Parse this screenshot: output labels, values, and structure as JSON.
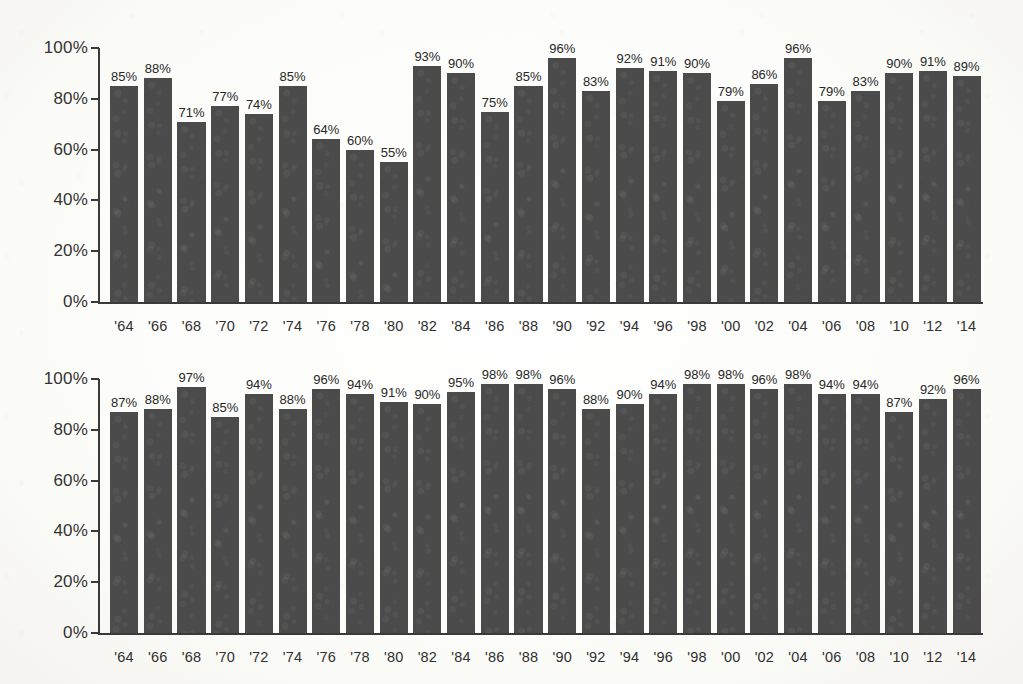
{
  "chart_data": [
    {
      "id": "chart-top",
      "type": "bar",
      "title": "",
      "subtitle": "",
      "xlabel": "",
      "ylabel": "",
      "ylim": [
        0,
        100
      ],
      "y_ticks": [
        0,
        20,
        40,
        60,
        80,
        100
      ],
      "y_tick_labels": [
        "0%",
        "20%",
        "40%",
        "60%",
        "80%",
        "100%"
      ],
      "grid": false,
      "legend": null,
      "value_label_suffix": "%",
      "bar_color": "#4b4b4b",
      "categories": [
        "'64",
        "'66",
        "'68",
        "'70",
        "'72",
        "'74",
        "'76",
        "'78",
        "'80",
        "'82",
        "'84",
        "'86",
        "'88",
        "'90",
        "'92",
        "'94",
        "'96",
        "'98",
        "'00",
        "'02",
        "'04",
        "'06",
        "'08",
        "'10",
        "'12",
        "'14"
      ],
      "values": [
        85,
        88,
        71,
        77,
        74,
        85,
        64,
        60,
        55,
        93,
        90,
        75,
        85,
        96,
        83,
        92,
        91,
        90,
        79,
        86,
        96,
        79,
        83,
        90,
        91,
        89
      ],
      "value_labels": [
        "85%",
        "88%",
        "71%",
        "77%",
        "74%",
        "85%",
        "64%",
        "60%",
        "55%",
        "93%",
        "90%",
        "75%",
        "85%",
        "96%",
        "83%",
        "92%",
        "91%",
        "90%",
        "79%",
        "86%",
        "96%",
        "79%",
        "83%",
        "90%",
        "91%",
        "89%"
      ]
    },
    {
      "id": "chart-bottom",
      "type": "bar",
      "title": "",
      "subtitle": "",
      "xlabel": "",
      "ylabel": "",
      "ylim": [
        0,
        100
      ],
      "y_ticks": [
        0,
        20,
        40,
        60,
        80,
        100
      ],
      "y_tick_labels": [
        "0%",
        "20%",
        "40%",
        "60%",
        "80%",
        "100%"
      ],
      "grid": false,
      "legend": null,
      "value_label_suffix": "%",
      "bar_color": "#4b4b4b",
      "categories": [
        "'64",
        "'66",
        "'68",
        "'70",
        "'72",
        "'74",
        "'76",
        "'78",
        "'80",
        "'82",
        "'84",
        "'86",
        "'88",
        "'90",
        "'92",
        "'94",
        "'96",
        "'98",
        "'00",
        "'02",
        "'04",
        "'06",
        "'08",
        "'10",
        "'12",
        "'14"
      ],
      "values": [
        87,
        88,
        97,
        85,
        94,
        88,
        96,
        94,
        91,
        90,
        95,
        98,
        98,
        96,
        88,
        90,
        94,
        98,
        98,
        96,
        98,
        94,
        94,
        87,
        92,
        96
      ],
      "value_labels": [
        "87%",
        "88%",
        "97%",
        "85%",
        "94%",
        "88%",
        "96%",
        "94%",
        "91%",
        "90%",
        "95%",
        "98%",
        "98%",
        "96%",
        "88%",
        "90%",
        "94%",
        "98%",
        "98%",
        "96%",
        "98%",
        "94%",
        "94%",
        "87%",
        "92%",
        "96%"
      ]
    }
  ]
}
